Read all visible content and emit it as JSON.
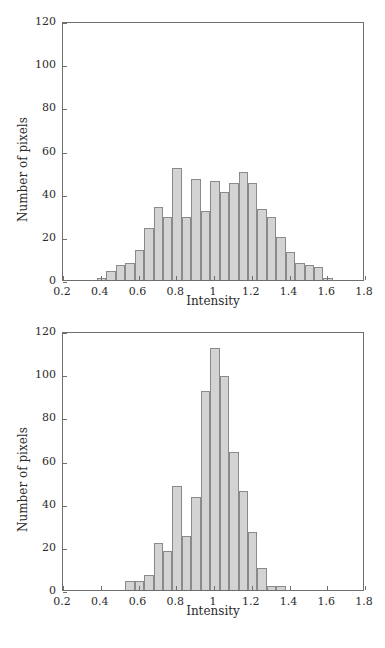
{
  "figure": {
    "panels": [
      {
        "id": "top",
        "xlabel": "Intensity",
        "ylabel": "Number of pixels",
        "xticks": [
          "0.2",
          "0.4",
          "0.6",
          "0.8",
          "1",
          "1.2",
          "1.4",
          "1.6",
          "1.8"
        ],
        "yticks": [
          "0",
          "20",
          "40",
          "60",
          "80",
          "100",
          "120"
        ]
      },
      {
        "id": "bottom",
        "xlabel": "Intensity",
        "ylabel": "Number of pixels",
        "xticks": [
          "0.2",
          "0.4",
          "0.6",
          "0.8",
          "1",
          "1.2",
          "1.4",
          "1.6",
          "1.8"
        ],
        "yticks": [
          "0",
          "20",
          "40",
          "60",
          "80",
          "100",
          "120"
        ]
      }
    ]
  },
  "chart_data": [
    {
      "type": "bar",
      "title": "",
      "xlabel": "Intensity",
      "ylabel": "Number of pixels",
      "xlim": [
        0.2,
        1.8
      ],
      "ylim": [
        0,
        120
      ],
      "xtick_values": [
        0.2,
        0.4,
        0.6,
        0.8,
        1.0,
        1.2,
        1.4,
        1.6,
        1.8
      ],
      "ytick_values": [
        0,
        20,
        40,
        60,
        80,
        100,
        120
      ],
      "grid": false,
      "legend": null,
      "bin_width": 0.05,
      "bin_starts": [
        0.38,
        0.43,
        0.48,
        0.53,
        0.58,
        0.63,
        0.68,
        0.73,
        0.78,
        0.83,
        0.88,
        0.93,
        0.98,
        1.03,
        1.08,
        1.13,
        1.18,
        1.23,
        1.28,
        1.33,
        1.38,
        1.43,
        1.48,
        1.53,
        1.58
      ],
      "categories": [
        "0.40",
        "0.45",
        "0.50",
        "0.55",
        "0.60",
        "0.65",
        "0.70",
        "0.75",
        "0.80",
        "0.85",
        "0.90",
        "0.95",
        "1.00",
        "1.05",
        "1.10",
        "1.15",
        "1.20",
        "1.25",
        "1.30",
        "1.35",
        "1.40",
        "1.45",
        "1.50",
        "1.55",
        "1.60"
      ],
      "values": [
        1,
        4,
        7,
        8,
        14,
        24,
        34,
        29,
        52,
        29,
        47,
        32,
        46,
        41,
        45,
        50,
        45,
        33,
        29,
        20,
        13,
        8,
        7,
        6,
        1
      ]
    },
    {
      "type": "bar",
      "title": "",
      "xlabel": "Intensity",
      "ylabel": "Number of pixels",
      "xlim": [
        0.2,
        1.8
      ],
      "ylim": [
        0,
        120
      ],
      "xtick_values": [
        0.2,
        0.4,
        0.6,
        0.8,
        1.0,
        1.2,
        1.4,
        1.6,
        1.8
      ],
      "ytick_values": [
        0,
        20,
        40,
        60,
        80,
        100,
        120
      ],
      "grid": false,
      "legend": null,
      "bin_width": 0.05,
      "bin_starts": [
        0.53,
        0.58,
        0.63,
        0.68,
        0.73,
        0.78,
        0.83,
        0.88,
        0.93,
        0.98,
        1.03,
        1.08,
        1.13,
        1.18,
        1.23,
        1.28,
        1.33
      ],
      "categories": [
        "0.55",
        "0.60",
        "0.65",
        "0.70",
        "0.75",
        "0.80",
        "0.85",
        "0.90",
        "0.95",
        "1.00",
        "1.05",
        "1.10",
        "1.15",
        "1.20",
        "1.25",
        "1.30",
        "1.35"
      ],
      "values": [
        4,
        4,
        7,
        22,
        18,
        48,
        25,
        43,
        92,
        112,
        99,
        64,
        46,
        27,
        10,
        2,
        2
      ]
    }
  ],
  "style": {
    "bar_fill": "#d3d3d3",
    "bar_stroke": "#8a8a8a",
    "axis_color": "#6e6e6e",
    "text_color": "#2b2b2b",
    "background": "#ffffff"
  }
}
